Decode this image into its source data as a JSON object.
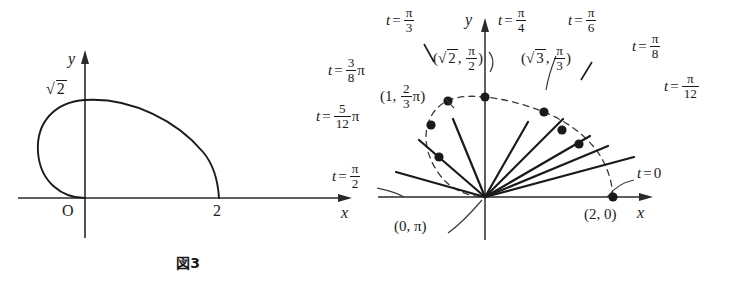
{
  "figure3": {
    "caption_label": "図3",
    "axis_x": "x",
    "axis_y": "y",
    "origin_label": "O",
    "y_intercept_label": "√2",
    "y_intercept_value": 1.4142,
    "x_intercept_label": "2",
    "x_intercept_value": 2,
    "curve_description": "closed loop from origin O, up to y = √2 on the y-axis, right and down to (2, 0)"
  },
  "figure4": {
    "caption_label": "図4",
    "caption_note_prefix": "ただし, (　)内は, (",
    "caption_note_r": "r",
    "caption_note_sep": ", ",
    "caption_note_theta": "θ",
    "caption_note_suffix": ")",
    "axis_x": "x",
    "axis_y": "y",
    "ray_labels": [
      {
        "name": "t-equals-0",
        "t_text": "t = 0",
        "num": "",
        "den": "",
        "pi_after": false,
        "angle_deg": 0
      },
      {
        "name": "t-equals-pi-12",
        "t_text": "t = π/12",
        "num": "π",
        "den": "12",
        "pi_after": false,
        "angle_deg": 15
      },
      {
        "name": "t-equals-pi-8",
        "t_text": "t = π/8",
        "num": "π",
        "den": "8",
        "pi_after": false,
        "angle_deg": 22.5
      },
      {
        "name": "t-equals-pi-6",
        "t_text": "t = π/6",
        "num": "π",
        "den": "6",
        "pi_after": false,
        "angle_deg": 30
      },
      {
        "name": "t-equals-pi-4",
        "t_text": "t = π/4",
        "num": "π",
        "den": "4",
        "pi_after": false,
        "angle_deg": 45
      },
      {
        "name": "t-equals-pi-3",
        "t_text": "t = π/3",
        "num": "π",
        "den": "3",
        "pi_after": false,
        "angle_deg": 60
      },
      {
        "name": "t-equals-3pi-8",
        "t_text": "t = 3/8 π",
        "num": "3",
        "den": "8",
        "pi_after": true,
        "angle_deg": 67.5
      },
      {
        "name": "t-equals-5pi-12",
        "t_text": "t = 5/12 π",
        "num": "5",
        "den": "12",
        "pi_after": true,
        "angle_deg": 75
      },
      {
        "name": "t-equals-pi-2",
        "t_text": "t = π/2",
        "num": "π",
        "den": "2",
        "pi_after": false,
        "angle_deg": 90
      }
    ],
    "point_labels": [
      {
        "name": "point-2-0",
        "text": "(2, 0)",
        "r": 2,
        "theta": "0"
      },
      {
        "name": "point-sqrt3-pi-3",
        "text": "(√3, π/3)",
        "r": 1.732,
        "theta": "π/3"
      },
      {
        "name": "point-sqrt2-pi-2",
        "text": "(√2, π/2)",
        "r": 1.4142,
        "theta": "π/2"
      },
      {
        "name": "point-1-2pi-3",
        "text": "(1, 2/3 π)",
        "r": 1,
        "theta": "2π/3"
      },
      {
        "name": "point-0-pi",
        "text": "(0, π)",
        "r": 0,
        "theta": "π"
      }
    ]
  },
  "colors": {
    "ink": "#1a1a1a",
    "axis": "#2a2a2a",
    "dashed": "#3a3a3a",
    "background": "#ffffff"
  }
}
